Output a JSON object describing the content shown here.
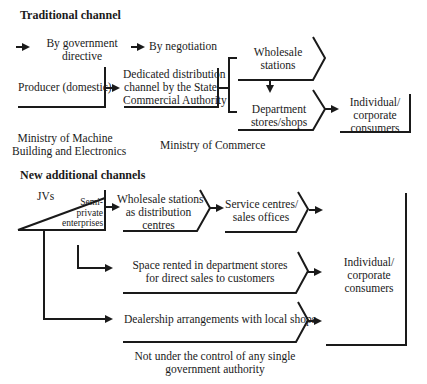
{
  "traditional": {
    "heading": "Traditional channel",
    "legend": {
      "directive": "By government directive",
      "directive_l1": "By government",
      "directive_l2": "directive",
      "negotiation": "By negotiation"
    },
    "producer": "Producer (domestic)",
    "dedicated": {
      "l1": "Dedicated distribution",
      "l2": "channel by the State",
      "l3": "Commercial Authority"
    },
    "wholesale": {
      "l1": "Wholesale",
      "l2": "stations"
    },
    "department": {
      "l1": "Department",
      "l2": "stores/shops"
    },
    "consumers": {
      "l1": "Individual/",
      "l2": "corporate",
      "l3": "consumers"
    },
    "ministry_machine": {
      "l1": "Ministry of Machine",
      "l2": "Building and Electronics"
    },
    "ministry_commerce": "Ministry of Commerce"
  },
  "new": {
    "heading": "New additional channels",
    "jvs": "JVs",
    "semi": {
      "l1": "Semi-",
      "l2": "private",
      "l3": "enterprises"
    },
    "wholesale_dc": {
      "l1": "Wholesale stations",
      "l2": "as distribution",
      "l3": "centres"
    },
    "service": {
      "l1": "Service centres/",
      "l2": "sales offices"
    },
    "space": {
      "l1": "Space rented in department stores",
      "l2": "for direct sales to customers"
    },
    "dealership": "Dealership arrangements with local shops",
    "consumers": {
      "l1": "Individual/",
      "l2": "corporate",
      "l3": "consumers"
    },
    "footnote": {
      "l1": "Not under the control of any single",
      "l2": "government authority"
    }
  },
  "colors": {
    "ink": "#1a1a1a",
    "background": "#ffffff"
  }
}
